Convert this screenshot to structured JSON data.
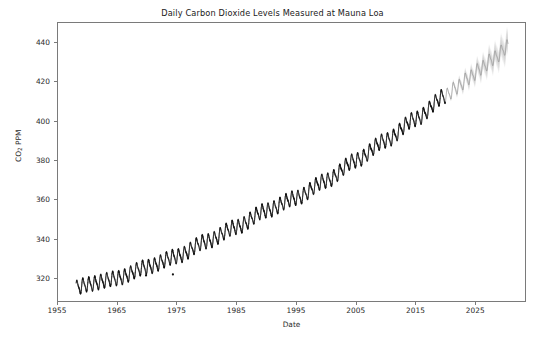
{
  "figure": {
    "width": 545,
    "height": 341,
    "background": "#ffffff",
    "axes_border_color": "#7a7a7a"
  },
  "chart_data": {
    "type": "line",
    "title": "Daily Carbon Dioxide Levels Measured at Mauna Loa",
    "xlabel": "Date",
    "ylabel_prefix": "CO",
    "ylabel_subscript": "2",
    "ylabel_suffix": " PPM",
    "ylabel": "CO2 PPM",
    "grid": false,
    "legend": "none",
    "xlim": [
      1955,
      2033.5
    ],
    "ylim": [
      308,
      450
    ],
    "xticks": [
      1955,
      1965,
      1975,
      1985,
      1995,
      2005,
      2015,
      2025
    ],
    "xtick_labels": [
      "1955",
      "1965",
      "1975",
      "1985",
      "1995",
      "2005",
      "2015",
      "2025"
    ],
    "yticks": [
      320,
      340,
      360,
      380,
      400,
      420,
      440
    ],
    "ytick_labels": [
      "320",
      "340",
      "360",
      "380",
      "400",
      "420",
      "440"
    ],
    "series": [
      {
        "name": "Observed daily CO2",
        "color": "#111111",
        "style": "solid",
        "linewidth": 0.7,
        "x_start": 1958.2,
        "x_end": 2020.0,
        "description": "Dense daily observations with strong annual seasonal oscillation on a rising trend",
        "seasonal_amplitude_ppm": 3.2,
        "anchor_points": [
          {
            "year": 1958.2,
            "value": 315.3
          },
          {
            "year": 1960,
            "value": 316.9
          },
          {
            "year": 1965,
            "value": 320.0
          },
          {
            "year": 1970,
            "value": 325.7
          },
          {
            "year": 1975,
            "value": 331.1
          },
          {
            "year": 1980,
            "value": 338.7
          },
          {
            "year": 1985,
            "value": 346.0
          },
          {
            "year": 1990,
            "value": 354.4
          },
          {
            "year": 1995,
            "value": 360.8
          },
          {
            "year": 2000,
            "value": 369.5
          },
          {
            "year": 2005,
            "value": 379.8
          },
          {
            "year": 2010,
            "value": 389.9
          },
          {
            "year": 2015,
            "value": 400.8
          },
          {
            "year": 2020,
            "value": 412.5
          }
        ],
        "outliers": [
          {
            "year": 1974.4,
            "value": 322.0
          },
          {
            "year": 1969.9,
            "value": 321.5
          }
        ]
      },
      {
        "name": "Forecast CO2",
        "color": "#8c8c8c",
        "style": "solid",
        "linewidth": 0.7,
        "x_start": 2020.0,
        "x_end": 2030.5,
        "description": "Lighter gray forecast continuation with seasonal cycle preserved",
        "seasonal_amplitude_ppm": 3.2,
        "anchor_points": [
          {
            "year": 2020,
            "value": 412.5
          },
          {
            "year": 2022,
            "value": 417.0
          },
          {
            "year": 2024,
            "value": 421.8
          },
          {
            "year": 2026,
            "value": 426.6
          },
          {
            "year": 2028,
            "value": 431.5
          },
          {
            "year": 2030.5,
            "value": 437.5
          }
        ]
      },
      {
        "name": "Forecast uncertainty band",
        "color": "#bfbfbf",
        "style": "shaded",
        "description": "Fading gray interval that widens with forecast horizon",
        "x_start": 2020.0,
        "x_end": 2030.5,
        "half_width_start_ppm": 0.4,
        "half_width_end_ppm": 6.5
      }
    ]
  }
}
